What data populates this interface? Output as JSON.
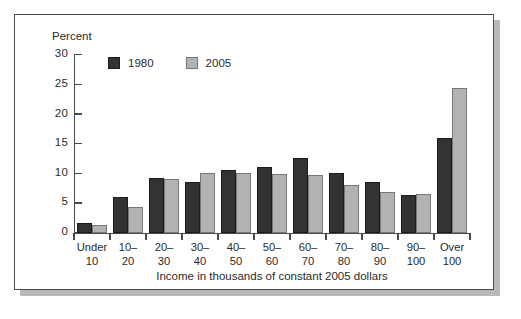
{
  "chart_data": {
    "type": "bar",
    "title": "",
    "xlabel": "Income in thousands of constant 2005 dollars",
    "ylabel": "Percent",
    "ylim": [
      0,
      30
    ],
    "yticks": [
      0,
      5,
      10,
      15,
      20,
      25,
      30
    ],
    "grid": false,
    "legend_position": "top-left-inside",
    "categories": [
      "Under\n10",
      "10–\n20",
      "20–\n30",
      "30–\n40",
      "40–\n50",
      "50–\n60",
      "60–\n70",
      "70–\n80",
      "80–\n90",
      "90–\n100",
      "Over\n100"
    ],
    "series": [
      {
        "name": "1980",
        "color": "#333333",
        "values": [
          1.7,
          6.0,
          9.2,
          8.6,
          10.6,
          11.0,
          12.6,
          10.0,
          8.6,
          6.3,
          16.0
        ]
      },
      {
        "name": "2005",
        "color": "#b2b2b2",
        "values": [
          1.3,
          4.3,
          9.1,
          10.1,
          10.1,
          9.9,
          9.7,
          8.1,
          6.8,
          6.5,
          24.4
        ]
      }
    ]
  },
  "legend": {
    "items": [
      {
        "label": "1980"
      },
      {
        "label": "2005"
      }
    ]
  },
  "colors": {
    "series_1980": "#333333",
    "series_2005": "#b2b2b2",
    "axis": "#4a4a4a",
    "text": "#2b2b2b",
    "frame_border": "#4a4a4a",
    "frame_shadow": "#b9b9b9",
    "background": "#ffffff"
  }
}
